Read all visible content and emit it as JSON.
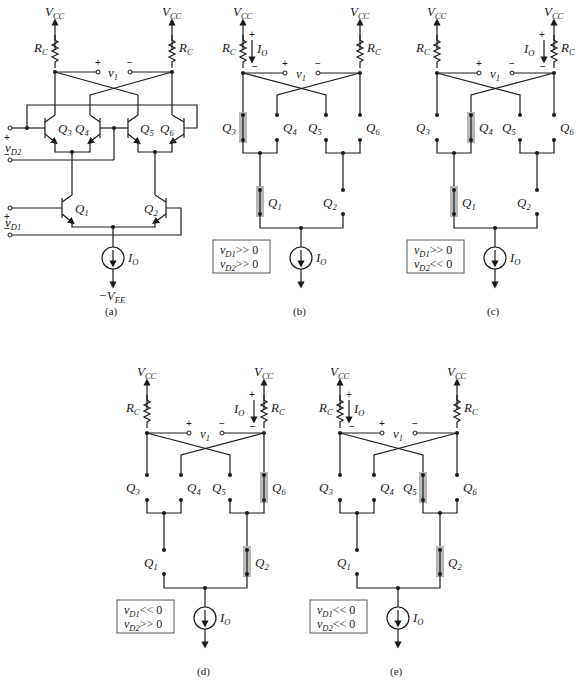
{
  "figure": {
    "panels": [
      {
        "id": "a",
        "caption": "(a)",
        "supply_top": "CC",
        "resistor": "C",
        "output": "1",
        "transistors": [
          "3",
          "4",
          "5",
          "6",
          "1",
          "2"
        ],
        "inputs": [
          "D2",
          "D1"
        ],
        "current_source": "O",
        "supply_bottom": "EE"
      },
      {
        "id": "b",
        "caption": "(b)",
        "conditions": [
          "v_D1 >> 0",
          "v_D2 >> 0"
        ],
        "cond_text": [
          ">> 0",
          ">> 0"
        ],
        "active": [
          "Q3",
          "Q1"
        ],
        "current_in": "left"
      },
      {
        "id": "c",
        "caption": "(c)",
        "conditions": [
          "v_D1 >> 0",
          "v_D2 << 0"
        ],
        "cond_text": [
          ">> 0",
          "<< 0"
        ],
        "active": [
          "Q4",
          "Q1"
        ],
        "current_in": "right"
      },
      {
        "id": "d",
        "caption": "(d)",
        "conditions": [
          "v_D1 << 0",
          "v_D2 >> 0"
        ],
        "cond_text": [
          "<< 0",
          ">> 0"
        ],
        "active": [
          "Q6",
          "Q2"
        ],
        "current_in": "right"
      },
      {
        "id": "e",
        "caption": "(e)",
        "conditions": [
          "v_D1 << 0",
          "v_D2 << 0"
        ],
        "cond_text": [
          "<< 0",
          "<< 0"
        ],
        "active": [
          "Q5",
          "Q2"
        ],
        "current_in": "left"
      }
    ],
    "labels": {
      "V": "V",
      "R": "R",
      "Q": "Q",
      "I": "I",
      "v": "v",
      "neg_V": "−V",
      "plus": "+",
      "minus": "−"
    }
  }
}
